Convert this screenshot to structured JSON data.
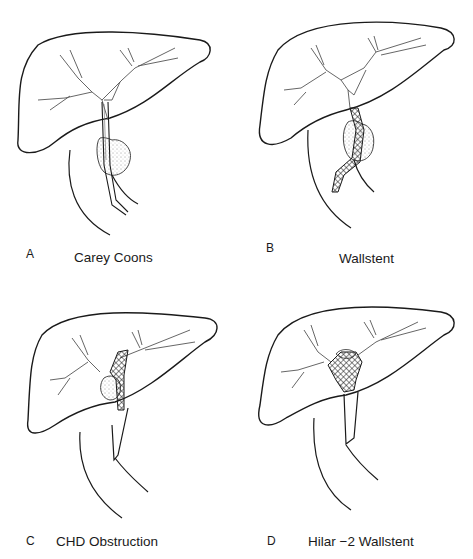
{
  "figure": {
    "panels": [
      {
        "letter": "A",
        "caption": "Carey Coons",
        "device": "plastic-stent",
        "lesion": "distal-CBD-mass"
      },
      {
        "letter": "B",
        "caption": "Wallstent",
        "device": "metal-mesh-stent",
        "lesion": "distal-CBD-mass"
      },
      {
        "letter": "C",
        "caption": "CHD Obstruction",
        "device": "metal-mesh-stent",
        "lesion": "CHD-mass"
      },
      {
        "letter": "D",
        "caption": "Hilar −2 Wallstent",
        "device": "two-metal-mesh-stents",
        "lesion": "hilar-mass"
      }
    ]
  },
  "colors": {
    "line": "#1a1a1a",
    "duct": "#555555",
    "background": "#ffffff"
  }
}
